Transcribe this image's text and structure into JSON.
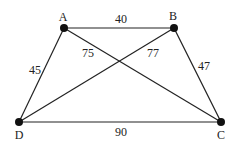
{
  "diagram": {
    "type": "weighted-graph",
    "line_color": "#222222",
    "node_color": "#111111",
    "nodes": [
      {
        "id": "A",
        "label": "A",
        "x": 64,
        "y": 28,
        "lx": 63,
        "ly": 17
      },
      {
        "id": "B",
        "label": "B",
        "x": 174,
        "y": 28,
        "lx": 173,
        "ly": 16
      },
      {
        "id": "C",
        "label": "C",
        "x": 221,
        "y": 122,
        "lx": 221,
        "ly": 135
      },
      {
        "id": "D",
        "label": "D",
        "x": 19,
        "y": 122,
        "lx": 19,
        "ly": 135
      }
    ],
    "edges": [
      {
        "from": "A",
        "to": "B",
        "weight": "40",
        "lx": 121,
        "ly": 19
      },
      {
        "from": "A",
        "to": "D",
        "weight": "45",
        "lx": 35,
        "ly": 70
      },
      {
        "from": "A",
        "to": "C",
        "weight": "75",
        "lx": 88,
        "ly": 53
      },
      {
        "from": "B",
        "to": "D",
        "weight": "77",
        "lx": 153,
        "ly": 53
      },
      {
        "from": "B",
        "to": "C",
        "weight": "47",
        "lx": 204,
        "ly": 66
      },
      {
        "from": "D",
        "to": "C",
        "weight": "90",
        "lx": 121,
        "ly": 132
      }
    ]
  }
}
